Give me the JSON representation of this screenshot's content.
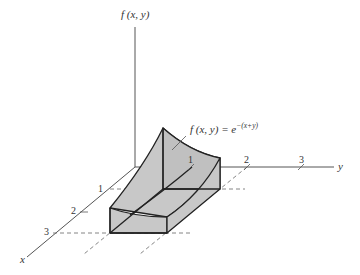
{
  "diagram": {
    "axes": {
      "z_label": "f (x, y)",
      "y_label": "y",
      "x_label": "x"
    },
    "y_ticks": [
      "1",
      "2",
      "3"
    ],
    "x_ticks": [
      "1",
      "2",
      "3"
    ],
    "function_label": {
      "main": "f (x, y) = e",
      "exponent": "−(x+y)"
    },
    "colors": {
      "surface_fill": "#c8c8c8",
      "edge": "#222222",
      "axis": "#555555",
      "dash": "#666666"
    }
  }
}
